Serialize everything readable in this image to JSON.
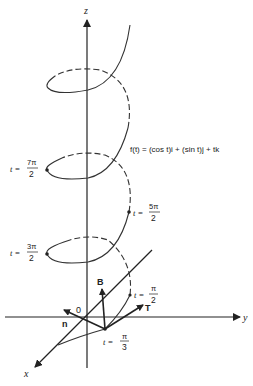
{
  "figure": {
    "type": "helix-diagram",
    "equation": {
      "lhs": "f(t)",
      "text": "f(t) = (cos t)i + (sin t)j + tk"
    },
    "axes": {
      "x_label": "x",
      "y_label": "y",
      "z_label": "z",
      "origin_label": "0"
    },
    "vectors": {
      "tangent": "T",
      "binormal": "B",
      "normal": "n"
    },
    "points": [
      {
        "t_prefix": "t =",
        "num": "π",
        "den": "3"
      },
      {
        "t_prefix": "t =",
        "num": "π",
        "den": "2"
      },
      {
        "t_prefix": "t =",
        "num": "3π",
        "den": "2"
      },
      {
        "t_prefix": "t =",
        "num": "5π",
        "den": "2"
      },
      {
        "t_prefix": "t =",
        "num": "7π",
        "den": "2"
      }
    ],
    "colors": {
      "ink": "#222222",
      "background": "#ffffff"
    }
  }
}
